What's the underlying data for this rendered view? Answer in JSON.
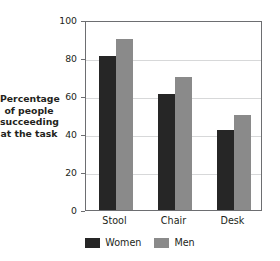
{
  "chart_data": {
    "type": "bar",
    "title": "",
    "subtitle": "",
    "xlabel": "",
    "ylabel": "Percentage of people succeeding at the task",
    "ylabel_lines": [
      "Percentage",
      "of people",
      "succeeding",
      "at the task"
    ],
    "categories": [
      "Stool",
      "Chair",
      "Desk"
    ],
    "series": [
      {
        "name": "Women",
        "color": "#262626",
        "values": [
          81,
          61,
          42
        ]
      },
      {
        "name": "Men",
        "color": "#8a8a8a",
        "values": [
          90,
          70,
          50
        ]
      }
    ],
    "ylim": [
      0,
      100
    ],
    "yticks": [
      0,
      20,
      40,
      60,
      80,
      100
    ],
    "ytick_labels": [
      "0",
      "20",
      "40",
      "60",
      "80",
      "100"
    ],
    "grid": true,
    "grid_axis": "y",
    "legend_position": "bottom"
  },
  "colors": {
    "women": "#262626",
    "men": "#8a8a8a",
    "gridline": "#d7d8d9",
    "axis": "#6d6e71",
    "text": "#231f20",
    "background": "#ffffff"
  }
}
